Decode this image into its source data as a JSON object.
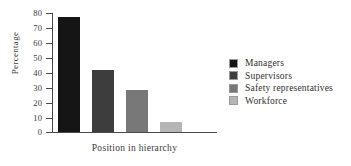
{
  "chart_data": {
    "type": "bar",
    "title": "",
    "subtitle": "",
    "xlabel": "Position in hierarchy",
    "ylabel": "Percentage",
    "categories": [
      "Managers",
      "Supervisors",
      "Safety representatives",
      "Workforce"
    ],
    "values": [
      77.5,
      42,
      28,
      7
    ],
    "ylim": [
      0,
      80
    ],
    "ytick_labels": [
      "80",
      "70",
      "60",
      "50",
      "40",
      "30",
      "20",
      "10",
      "0"
    ],
    "ytick_values": [
      80,
      70,
      60,
      50,
      40,
      30,
      20,
      10,
      0
    ],
    "ytick_step": 10,
    "xtick_labels": [],
    "grid": false,
    "legend_position": "right",
    "series": [
      {
        "name": "Percentage of respondents",
        "values": [
          77.5,
          42,
          28,
          7
        ]
      }
    ],
    "bar_colors": [
      "#151515",
      "#3d3d3d",
      "#787878",
      "#b5b5b5"
    ],
    "legend": [
      {
        "label": "Managers",
        "color": "#151515",
        "value": 77.5
      },
      {
        "label": "Supervisors",
        "color": "#3d3d3d",
        "value": 42
      },
      {
        "label": "Safety representatives",
        "color": "#787878",
        "value": 28
      },
      {
        "label": "Workforce",
        "color": "#b5b5b5",
        "value": 7
      }
    ],
    "axis_color": "#4a4a4a",
    "background": "#ffffff"
  }
}
